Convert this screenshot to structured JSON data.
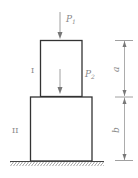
{
  "diagram": {
    "type": "stacked-column-loading",
    "loads": [
      {
        "id": "P1",
        "label": "P",
        "subscript": "1",
        "direction": "down",
        "applied_to": "top of segment I"
      },
      {
        "id": "P2",
        "label": "P",
        "subscript": "2",
        "direction": "down",
        "applied_to": "segment I (transmitted to segment II)"
      }
    ],
    "segments": [
      {
        "id": "I",
        "label": "I",
        "length_label": "a"
      },
      {
        "id": "II",
        "label": "II",
        "length_label": "b"
      }
    ],
    "dimensions": {
      "upper": "a",
      "lower": "b"
    },
    "support": "fixed ground (hatched)"
  }
}
